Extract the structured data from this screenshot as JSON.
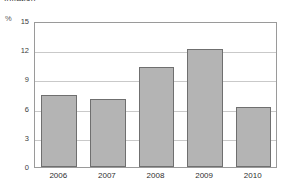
{
  "chart_data": {
    "type": "bar",
    "title": "Inflation",
    "subtitle": "",
    "xlabel": "",
    "ylabel": "%",
    "unit_label": "%",
    "categories": [
      "2006",
      "2007",
      "2008",
      "2009",
      "2010"
    ],
    "values": [
      7.4,
      7.0,
      10.3,
      12.1,
      6.2
    ],
    "series": [
      {
        "name": "Inflation",
        "values": [
          7.4,
          7.0,
          10.3,
          12.1,
          6.2
        ]
      }
    ],
    "ylim": [
      0,
      15
    ],
    "yticks": [
      0,
      3,
      6,
      9,
      12,
      15
    ],
    "ytick_labels": [
      "0",
      "3",
      "6",
      "9",
      "12",
      "15"
    ],
    "grid": true,
    "grid_axis": "y",
    "legend": false,
    "legend_position": "none",
    "bar_fill_color": "#b4b4b4",
    "bar_edge_color": "#6f6f6f",
    "gridline_color": "#c9c9c9",
    "frame_color": "#9a9a9a",
    "background_color": "#ffffff",
    "text_color": "#2f2f2f"
  }
}
